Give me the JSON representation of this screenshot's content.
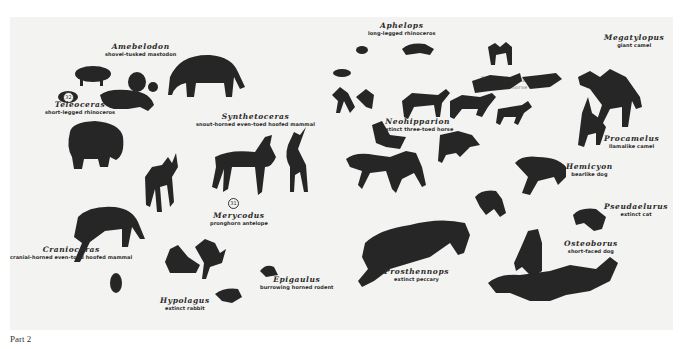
{
  "plate": {
    "background": "#f3f3f1",
    "silhouette_color": "#262626",
    "markers": [
      {
        "id": "marker-32",
        "text": "32"
      },
      {
        "id": "marker-31",
        "text": "31"
      }
    ],
    "labels": [
      {
        "genus": "Amebelodon",
        "common": "shovel-tusked mastodon"
      },
      {
        "genus": "Teleoceras",
        "common": "short-legged rhinoceros"
      },
      {
        "genus": "Synthetoceras",
        "common": "snout-horned even-toed hoofed mammal"
      },
      {
        "genus": "Aphelops",
        "common": "long-legged rhinoceros"
      },
      {
        "genus": "Megatylopus",
        "common": "giant camel"
      },
      {
        "genus": "Pliohippus",
        "common": "one-toed horse"
      },
      {
        "genus": "Neohipparion",
        "common": "extinct three-toed horse"
      },
      {
        "genus": "Procamelus",
        "common": "llamalike camel"
      },
      {
        "genus": "Hemicyon",
        "common": "bearlike dog"
      },
      {
        "genus": "Pseudaelurus",
        "common": "extinct cat"
      },
      {
        "genus": "Merycodus",
        "common": "pronghorn antelope"
      },
      {
        "genus": "Cranioceras",
        "common": "cranial-horned even-toed hoofed mammal"
      },
      {
        "genus": "Prosthennops",
        "common": "extinct peccary"
      },
      {
        "genus": "Osteoborus",
        "common": "short-faced dog"
      },
      {
        "genus": "Epigaulus",
        "common": "burrowing horned rodent"
      },
      {
        "genus": "Hypolagus",
        "common": "extinct rabbit"
      }
    ]
  },
  "caption": "Part 2"
}
